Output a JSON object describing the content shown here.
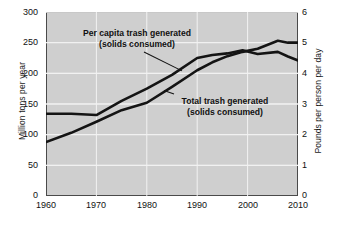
{
  "chart_data": {
    "type": "line",
    "title": "",
    "xlabel": "",
    "ylabel": "Million tons per year",
    "ylabel_right": "Pounds per person per day",
    "xlim": [
      1960,
      2010
    ],
    "ylim": [
      0,
      300
    ],
    "ylim_right": [
      0,
      6
    ],
    "grid": true,
    "legend": "annotations-inline",
    "xticks": [
      "1960",
      "1970",
      "1980",
      "1990",
      "2000",
      "2010"
    ],
    "xtick_values": [
      1960,
      1970,
      1980,
      1990,
      2000,
      2010
    ],
    "yticks_left": [
      "0",
      "50",
      "100",
      "150",
      "200",
      "250",
      "300"
    ],
    "ytick_values_left": [
      0,
      50,
      100,
      150,
      200,
      250,
      300
    ],
    "yticks_right": [
      "0",
      "1",
      "2",
      "3",
      "4",
      "5",
      "6"
    ],
    "ytick_values_right": [
      0,
      1,
      2,
      3,
      4,
      5,
      6
    ],
    "series": [
      {
        "name": "Total trash generated (solids consumed)",
        "axis": "left",
        "units": "million tons per year",
        "x": [
          1960,
          1965,
          1970,
          1975,
          1980,
          1985,
          1990,
          1993,
          1996,
          1999,
          2002,
          2006,
          2008,
          2010
        ],
        "values": [
          88,
          103,
          121,
          140,
          152,
          178,
          205,
          218,
          228,
          235,
          240,
          253,
          250,
          250
        ]
      },
      {
        "name": "Per capita trash generated (solids consumed)",
        "axis": "right",
        "units": "pounds per person per day",
        "x": [
          1960,
          1965,
          1970,
          1975,
          1980,
          1985,
          1990,
          1993,
          1996,
          1999,
          2002,
          2006,
          2008,
          2010
        ],
        "values": [
          2.68,
          2.68,
          2.64,
          3.1,
          3.5,
          3.95,
          4.5,
          4.6,
          4.65,
          4.75,
          4.63,
          4.7,
          4.55,
          4.42
        ]
      }
    ],
    "annotations": [
      {
        "id": "per-capita",
        "line1": "Per capita trash generated",
        "line2": "(solids consumed)",
        "points_to_series": "Per capita trash generated (solids consumed)"
      },
      {
        "id": "total",
        "line1": "Total trash generated",
        "line2": "(solids consumed)",
        "points_to_series": "Total trash generated (solids consumed)"
      }
    ],
    "colors": {
      "plot_background": "#cfcfcf",
      "gridline": "#f2f2f2",
      "line": "#141414",
      "frame": "#4a4a4a",
      "text": "#111111"
    }
  }
}
